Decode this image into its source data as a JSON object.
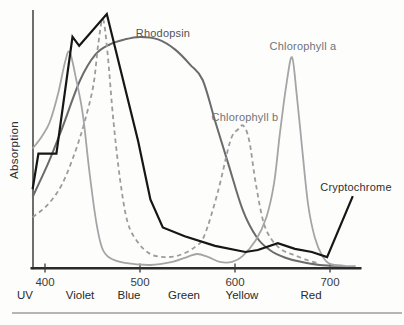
{
  "figure": {
    "background": "#fdfdfc",
    "bottom_rule_color": "#b5b6b6"
  },
  "chart_data": {
    "type": "line",
    "title": "",
    "xlabel": "",
    "ylabel": "Absorption",
    "ylim": [
      0,
      1
    ],
    "xlim_nm": [
      387,
      733
    ],
    "grid": false,
    "legend_position": "inline-labels",
    "x_ticks": [
      400,
      500,
      600,
      700
    ],
    "band_labels": [
      {
        "text": "UV",
        "x_px": 25
      },
      {
        "text": "Violet",
        "x_px": 80
      },
      {
        "text": "Blue",
        "x_px": 129
      },
      {
        "text": "Green",
        "x_px": 184
      },
      {
        "text": "Yellow",
        "x_px": 242
      },
      {
        "text": "Red",
        "x_px": 311
      }
    ],
    "axis_color": "#2b2b2b",
    "tick_label_color": "#3a3a3a",
    "band_label_color": "#2a2a2a",
    "series": [
      {
        "name": "Rhodopsin",
        "color": "#6a6b6d",
        "width": 2,
        "dash": null,
        "smooth": true,
        "label_px": [
          163,
          33
        ],
        "label_color": "#515254",
        "points": [
          [
            387,
            0.28
          ],
          [
            403,
            0.41
          ],
          [
            418,
            0.55
          ],
          [
            437,
            0.74
          ],
          [
            453,
            0.84
          ],
          [
            468,
            0.88
          ],
          [
            484,
            0.9
          ],
          [
            500,
            0.91
          ],
          [
            519,
            0.9
          ],
          [
            537,
            0.86
          ],
          [
            553,
            0.8
          ],
          [
            566,
            0.74
          ],
          [
            579,
            0.58
          ],
          [
            593,
            0.41
          ],
          [
            608,
            0.23
          ],
          [
            623,
            0.12
          ],
          [
            637,
            0.07
          ],
          [
            653,
            0.04
          ],
          [
            668,
            0.025
          ],
          [
            689,
            0.012
          ],
          [
            716,
            0.008
          ]
        ]
      },
      {
        "name": "Chlorophyll b",
        "color": "#9a9c9e",
        "width": 1.8,
        "dash": "4.5 3.5",
        "smooth": true,
        "label_px": [
          245,
          117
        ],
        "label_color": "#717376",
        "points": [
          [
            387,
            0.2
          ],
          [
            403,
            0.25
          ],
          [
            418,
            0.33
          ],
          [
            432,
            0.46
          ],
          [
            442,
            0.58
          ],
          [
            451,
            0.72
          ],
          [
            456,
            0.88
          ],
          [
            461,
            0.98
          ],
          [
            466,
            0.84
          ],
          [
            472,
            0.58
          ],
          [
            479,
            0.35
          ],
          [
            487,
            0.18
          ],
          [
            498,
            0.1
          ],
          [
            511,
            0.055
          ],
          [
            526,
            0.043
          ],
          [
            542,
            0.051
          ],
          [
            558,
            0.083
          ],
          [
            568,
            0.13
          ],
          [
            582,
            0.3
          ],
          [
            595,
            0.5
          ],
          [
            603,
            0.545
          ],
          [
            609,
            0.56
          ],
          [
            615,
            0.5
          ],
          [
            622,
            0.33
          ],
          [
            630,
            0.18
          ],
          [
            639,
            0.11
          ],
          [
            650,
            0.07
          ],
          [
            663,
            0.05
          ],
          [
            677,
            0.03
          ],
          [
            687,
            0.02
          ]
        ]
      },
      {
        "name": "Chlorophyll a",
        "color": "#a3a5a7",
        "width": 1.8,
        "dash": null,
        "smooth": true,
        "label_px": [
          303,
          46
        ],
        "label_color": "#717376",
        "points": [
          [
            387,
            0.47
          ],
          [
            397,
            0.52
          ],
          [
            405,
            0.575
          ],
          [
            414,
            0.69
          ],
          [
            421,
            0.81
          ],
          [
            426,
            0.85
          ],
          [
            433,
            0.74
          ],
          [
            440,
            0.6
          ],
          [
            447,
            0.37
          ],
          [
            454,
            0.18
          ],
          [
            460,
            0.08
          ],
          [
            468,
            0.04
          ],
          [
            484,
            0.02
          ],
          [
            511,
            0.012
          ],
          [
            534,
            0.024
          ],
          [
            547,
            0.04
          ],
          [
            560,
            0.055
          ],
          [
            572,
            0.043
          ],
          [
            584,
            0.024
          ],
          [
            597,
            0.024
          ],
          [
            608,
            0.047
          ],
          [
            622,
            0.11
          ],
          [
            633,
            0.2
          ],
          [
            641,
            0.33
          ],
          [
            647,
            0.52
          ],
          [
            654,
            0.72
          ],
          [
            660,
            0.83
          ],
          [
            665,
            0.68
          ],
          [
            671,
            0.46
          ],
          [
            677,
            0.25
          ],
          [
            684,
            0.12
          ],
          [
            692,
            0.047
          ],
          [
            700,
            0.016
          ],
          [
            716,
            0.008
          ],
          [
            727,
            0.008
          ]
        ]
      },
      {
        "name": "Cryptochrome",
        "color": "#161616",
        "width": 2.2,
        "dash": null,
        "smooth": false,
        "label_px": [
          356,
          187
        ],
        "label_color": "#2f2f31",
        "points": [
          [
            387,
            0.31
          ],
          [
            393,
            0.45
          ],
          [
            412,
            0.45
          ],
          [
            429,
            0.91
          ],
          [
            436,
            0.875
          ],
          [
            465,
            1.0
          ],
          [
            498,
            0.5
          ],
          [
            511,
            0.27
          ],
          [
            524,
            0.16
          ],
          [
            547,
            0.125
          ],
          [
            579,
            0.087
          ],
          [
            611,
            0.063
          ],
          [
            624,
            0.071
          ],
          [
            645,
            0.098
          ],
          [
            663,
            0.075
          ],
          [
            681,
            0.063
          ],
          [
            697,
            0.043
          ],
          [
            724,
            0.283
          ]
        ]
      }
    ]
  }
}
